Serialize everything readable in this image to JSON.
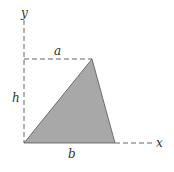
{
  "diagram": {
    "labels": {
      "y_axis": "y",
      "x_axis": "x",
      "top_width": "a",
      "height": "h",
      "base": "b"
    },
    "colors": {
      "fill": "#a8a8a8",
      "stroke": "#555555",
      "dash": "#666666",
      "text": "#333333"
    }
  }
}
